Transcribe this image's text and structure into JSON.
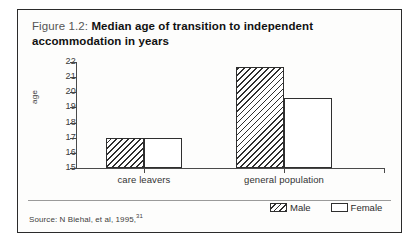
{
  "figure": {
    "label": "Figure 1.2:",
    "title": "Median age of transition to independent accommodation in years",
    "source_text": "Source: N Biehal, et al, 1995,",
    "source_ref": "31"
  },
  "legend": {
    "male_label": "Male",
    "female_label": "Female",
    "male_swatch_name": "hatched-swatch",
    "female_swatch_name": "empty-swatch"
  },
  "chart_data": {
    "type": "bar",
    "title": "Median age of transition to independent accommodation in years",
    "xlabel": "",
    "ylabel": "age",
    "categories": [
      "care leavers",
      "general population"
    ],
    "series": [
      {
        "name": "Male",
        "values": [
          17.0,
          21.7
        ]
      },
      {
        "name": "Female",
        "values": [
          17.0,
          19.6
        ]
      }
    ],
    "ylim": [
      15,
      22
    ],
    "yticks": [
      22,
      21,
      20,
      19,
      18,
      17,
      16,
      15
    ],
    "ytick_labels": [
      "22",
      "21",
      "20",
      "19",
      "18",
      "17",
      "16",
      "15"
    ],
    "grid": false,
    "legend_position": "bottom-right",
    "bar_style": {
      "Male": "diagonal-hatch",
      "Female": "solid-white"
    }
  }
}
